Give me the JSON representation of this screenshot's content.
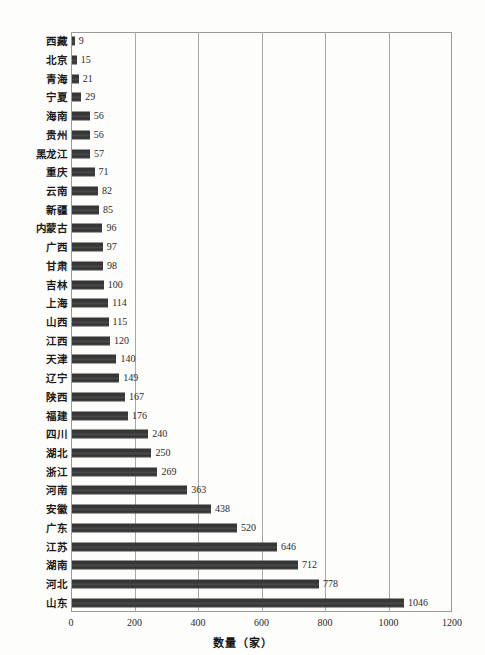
{
  "chart_data": {
    "type": "bar",
    "orientation": "horizontal",
    "title": "",
    "xlabel": "数量（家）",
    "ylabel": "",
    "xlim": [
      0,
      1200
    ],
    "xticks": [
      0,
      200,
      400,
      600,
      800,
      1000,
      1200
    ],
    "grid": true,
    "legend": null,
    "bar_color": "#3a3a3a",
    "categories": [
      "西藏",
      "北京",
      "青海",
      "宁夏",
      "海南",
      "贵州",
      "黑龙江",
      "重庆",
      "云南",
      "新疆",
      "内蒙古",
      "广西",
      "甘肃",
      "吉林",
      "上海",
      "山西",
      "江西",
      "天津",
      "辽宁",
      "陕西",
      "福建",
      "四川",
      "湖北",
      "浙江",
      "河南",
      "安徽",
      "广东",
      "江苏",
      "湖南",
      "河北",
      "山东"
    ],
    "values": [
      9,
      15,
      21,
      29,
      56,
      56,
      57,
      71,
      82,
      85,
      96,
      97,
      98,
      100,
      114,
      115,
      120,
      140,
      149,
      167,
      176,
      240,
      250,
      269,
      363,
      438,
      520,
      646,
      712,
      778,
      1046
    ]
  }
}
